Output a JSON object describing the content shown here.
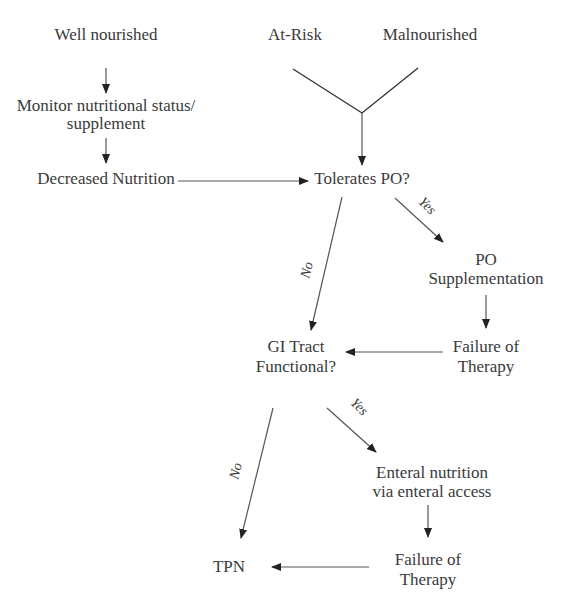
{
  "diagram": {
    "type": "flowchart",
    "nodes": {
      "well_nourished": "Well nourished",
      "at_risk": "At-Risk",
      "malnourished": "Malnourished",
      "monitor_1": "Monitor nutritional status/",
      "monitor_2": "supplement",
      "decreased": "Decreased Nutrition",
      "tolerates_po": "Tolerates PO?",
      "po_supp_1": "PO",
      "po_supp_2": "Supplementation",
      "failure1_1": "Failure of",
      "failure1_2": "Therapy",
      "gi_1": "GI Tract",
      "gi_2": "Functional?",
      "enteral_1": "Enteral nutrition",
      "enteral_2": "via enteral access",
      "failure2_1": "Failure of",
      "failure2_2": "Therapy",
      "tpn": "TPN"
    },
    "edge_labels": {
      "yes1": "Yes",
      "no1": "No",
      "yes2": "Yes",
      "no2": "No"
    },
    "edges": [
      {
        "from": "Well nourished",
        "to": "Monitor nutritional status/supplement"
      },
      {
        "from": "Monitor nutritional status/supplement",
        "to": "Decreased Nutrition"
      },
      {
        "from": "Decreased Nutrition",
        "to": "Tolerates PO?"
      },
      {
        "from": "At-Risk",
        "to": "Tolerates PO?"
      },
      {
        "from": "Malnourished",
        "to": "Tolerates PO?"
      },
      {
        "from": "Tolerates PO?",
        "to": "PO Supplementation",
        "label": "Yes"
      },
      {
        "from": "Tolerates PO?",
        "to": "GI Tract Functional?",
        "label": "No"
      },
      {
        "from": "PO Supplementation",
        "to": "Failure of Therapy"
      },
      {
        "from": "Failure of Therapy",
        "to": "GI Tract Functional?"
      },
      {
        "from": "GI Tract Functional?",
        "to": "Enteral nutrition via enteral access",
        "label": "Yes"
      },
      {
        "from": "GI Tract Functional?",
        "to": "TPN",
        "label": "No"
      },
      {
        "from": "Enteral nutrition via enteral access",
        "to": "Failure of Therapy"
      },
      {
        "from": "Failure of Therapy",
        "to": "TPN"
      }
    ]
  }
}
